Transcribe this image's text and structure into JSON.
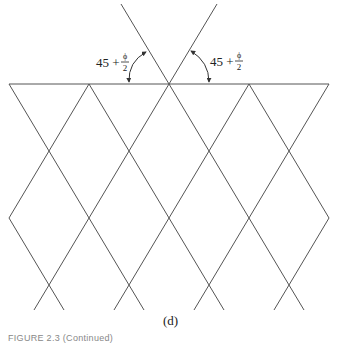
{
  "figure": {
    "subfigure_label": "(d)",
    "caption": "FIGURE 2.3 (Continued)",
    "angle_labels": [
      {
        "base": "45 +",
        "numerator": "ϕ",
        "denominator": "2"
      },
      {
        "base": "45 +",
        "numerator": "ϕ",
        "denominator": "2"
      }
    ],
    "line_color": "#555555",
    "ground_line": {
      "x1": 9,
      "x2": 329,
      "y": 84
    },
    "vertices_on_ground": [
      9,
      89,
      169,
      249,
      329
    ]
  }
}
